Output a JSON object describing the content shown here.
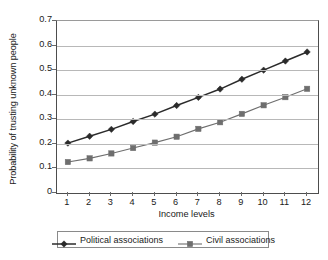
{
  "chart_data": {
    "type": "line",
    "title": "",
    "xlabel": "Income levels",
    "ylabel": "Probability of trusting unknown people",
    "x": [
      1,
      2,
      3,
      4,
      5,
      6,
      7,
      8,
      9,
      10,
      11,
      12
    ],
    "xtick_labels": [
      "1",
      "2",
      "3",
      "4",
      "5",
      "6",
      "7",
      "8",
      "9",
      "10",
      "11",
      "12"
    ],
    "ytick_labels": [
      "0.7",
      "0.6",
      "0.5",
      "0.4",
      "0.3",
      "0.2",
      "0.1",
      "0"
    ],
    "ytick_values": [
      0.7,
      0.6,
      0.5,
      0.4,
      0.3,
      0.2,
      0.1,
      0
    ],
    "ylim": [
      0,
      0.7
    ],
    "xlim": [
      0.5,
      12.5
    ],
    "grid": "horizontal",
    "legend_position": "bottom",
    "series": [
      {
        "name": "Political associations",
        "marker": "diamond",
        "color": "#2b2b2b",
        "values": [
          0.203,
          0.231,
          0.259,
          0.291,
          0.321,
          0.356,
          0.389,
          0.423,
          0.463,
          0.5,
          0.537,
          0.574
        ]
      },
      {
        "name": "Civil associations",
        "marker": "square",
        "color": "#6e6e6e",
        "values": [
          0.126,
          0.141,
          0.161,
          0.183,
          0.205,
          0.229,
          0.261,
          0.288,
          0.322,
          0.357,
          0.39,
          0.424
        ]
      }
    ]
  },
  "legend": {
    "entries": [
      {
        "label": "Political associations"
      },
      {
        "label": "Civil associations"
      }
    ]
  }
}
